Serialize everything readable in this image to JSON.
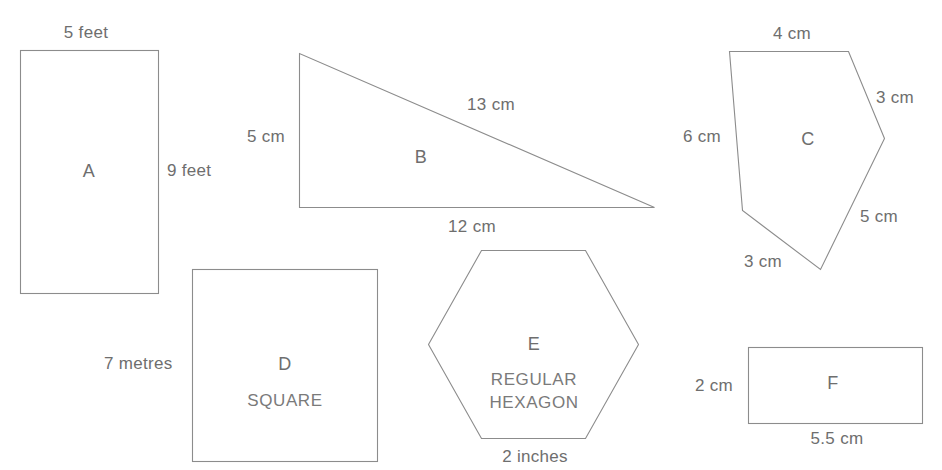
{
  "page": {
    "background_color": "#ffffff",
    "stroke_color": "#8c8c8c",
    "text_color": "#6e6e6e"
  },
  "shapes": [
    {
      "id": "A",
      "name": "rectangle-a",
      "type": "rectangle",
      "interior_label": "A",
      "dimensions": [
        {
          "name": "width",
          "text": "5 feet",
          "value": 5,
          "unit": "feet"
        },
        {
          "name": "height",
          "text": "9 feet",
          "value": 9,
          "unit": "feet"
        }
      ]
    },
    {
      "id": "B",
      "name": "triangle-b",
      "type": "right-triangle",
      "interior_label": "B",
      "dimensions": [
        {
          "name": "vertical-leg",
          "text": "5 cm",
          "value": 5,
          "unit": "cm"
        },
        {
          "name": "hypotenuse",
          "text": "13 cm",
          "value": 13,
          "unit": "cm"
        },
        {
          "name": "horizontal-leg",
          "text": "12 cm",
          "value": 12,
          "unit": "cm"
        }
      ]
    },
    {
      "id": "C",
      "name": "pentagon-c",
      "type": "irregular-pentagon",
      "interior_label": "C",
      "dimensions": [
        {
          "name": "top-side",
          "text": "4 cm",
          "value": 4,
          "unit": "cm"
        },
        {
          "name": "upper-right-side",
          "text": "3 cm",
          "value": 3,
          "unit": "cm"
        },
        {
          "name": "lower-right-side",
          "text": "5 cm",
          "value": 5,
          "unit": "cm"
        },
        {
          "name": "bottom-left-side",
          "text": "3 cm",
          "value": 3,
          "unit": "cm"
        },
        {
          "name": "left-side",
          "text": "6 cm",
          "value": 6,
          "unit": "cm"
        }
      ]
    },
    {
      "id": "D",
      "name": "square-d",
      "type": "square",
      "interior_label": "D",
      "interior_sublabel": "SQUARE",
      "dimensions": [
        {
          "name": "side",
          "text": "7 metres",
          "value": 7,
          "unit": "metres"
        }
      ]
    },
    {
      "id": "E",
      "name": "hexagon-e",
      "type": "regular-hexagon",
      "interior_label": "E",
      "interior_sublabel_line1": "REGULAR",
      "interior_sublabel_line2": "HEXAGON",
      "dimensions": [
        {
          "name": "side",
          "text": "2 inches",
          "value": 2,
          "unit": "inches"
        }
      ]
    },
    {
      "id": "F",
      "name": "rectangle-f",
      "type": "rectangle",
      "interior_label": "F",
      "dimensions": [
        {
          "name": "height",
          "text": "2 cm",
          "value": 2,
          "unit": "cm"
        },
        {
          "name": "width",
          "text": "5.5 cm",
          "value": 5.5,
          "unit": "cm"
        }
      ]
    }
  ],
  "labels": {
    "a_width": "5 feet",
    "a_height": "9 feet",
    "a_interior": "A",
    "b_left": "5 cm",
    "b_hyp": "13 cm",
    "b_base": "12 cm",
    "b_interior": "B",
    "c_top": "4 cm",
    "c_upper_right": "3 cm",
    "c_lower_right": "5 cm",
    "c_bottom": "3 cm",
    "c_left": "6 cm",
    "c_interior": "C",
    "d_side": "7 metres",
    "d_interior": "D",
    "d_sub": "SQUARE",
    "e_side": "2 inches",
    "e_interior": "E",
    "e_sub1": "REGULAR",
    "e_sub2": "HEXAGON",
    "f_height": "2 cm",
    "f_width": "5.5 cm",
    "f_interior": "F"
  }
}
